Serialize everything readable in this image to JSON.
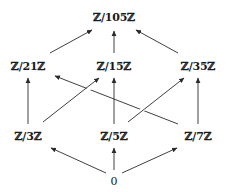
{
  "diagram": {
    "nodes": {
      "top": "ℤ/105ℤ",
      "n21": "ℤ/21ℤ",
      "n15": "ℤ/15ℤ",
      "n35": "ℤ/35ℤ",
      "n3": "ℤ/3ℤ",
      "n5": "ℤ/5ℤ",
      "n7": "ℤ/7ℤ",
      "zero": "0"
    },
    "edges": [
      {
        "from": "ℤ/21ℤ",
        "to": "ℤ/105ℤ"
      },
      {
        "from": "ℤ/15ℤ",
        "to": "ℤ/105ℤ"
      },
      {
        "from": "ℤ/35ℤ",
        "to": "ℤ/105ℤ"
      },
      {
        "from": "ℤ/3ℤ",
        "to": "ℤ/21ℤ"
      },
      {
        "from": "ℤ/3ℤ",
        "to": "ℤ/15ℤ"
      },
      {
        "from": "ℤ/5ℤ",
        "to": "ℤ/15ℤ"
      },
      {
        "from": "ℤ/5ℤ",
        "to": "ℤ/35ℤ"
      },
      {
        "from": "ℤ/7ℤ",
        "to": "ℤ/35ℤ"
      },
      {
        "from": "ℤ/7ℤ",
        "to": "ℤ/21ℤ"
      },
      {
        "from": "0",
        "to": "ℤ/3ℤ"
      },
      {
        "from": "0",
        "to": "ℤ/5ℤ"
      },
      {
        "from": "0",
        "to": "ℤ/7ℤ"
      }
    ],
    "colors": {
      "line": "#2a2a2a",
      "text": "#1a1a1a",
      "background": "#ffffff"
    }
  }
}
